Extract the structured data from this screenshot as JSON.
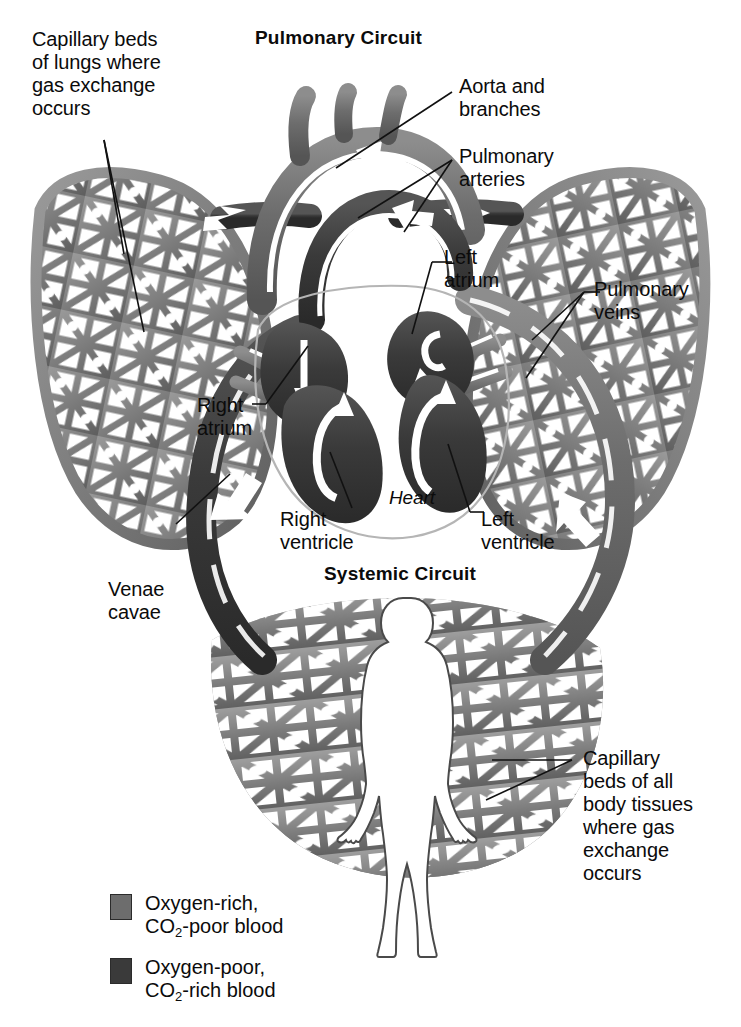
{
  "figure": {
    "title_top": "Pulmonary Circuit",
    "title_bottom": "Systemic Circuit",
    "heart_label": "Heart",
    "colors": {
      "oxygen_rich": "#6d6d6d",
      "oxygen_poor": "#3a3a3a",
      "capillary_bed": "#7d7d7d",
      "leader_line": "#111111",
      "text": "#0b0b0b",
      "background": "#ffffff",
      "body_outline": "#4a4a4a"
    }
  },
  "labels": {
    "capillary_lungs": "Capillary beds\nof lungs where\ngas exchange\noccurs",
    "aorta": "Aorta and\nbranches",
    "pulmonary_arteries": "Pulmonary\narteries",
    "left_atrium": "Left\natrium",
    "pulmonary_veins": "Pulmonary\nveins",
    "right_atrium": "Right\natrium",
    "right_ventricle": "Right\nventricle",
    "left_ventricle": "Left\nventricle",
    "venae_cavae": "Venae\ncavae",
    "capillary_body": "Capillary\nbeds of all\nbody tissues\nwhere gas\nexchange\noccurs"
  },
  "legend": {
    "items": [
      {
        "swatch_color": "#6d6d6d",
        "line1": "Oxygen-rich,",
        "line2_pre": "CO",
        "line2_sub": "2",
        "line2_post": "-poor blood"
      },
      {
        "swatch_color": "#3a3a3a",
        "line1": "Oxygen-poor,",
        "line2_pre": "CO",
        "line2_sub": "2",
        "line2_post": "-rich blood"
      }
    ]
  }
}
